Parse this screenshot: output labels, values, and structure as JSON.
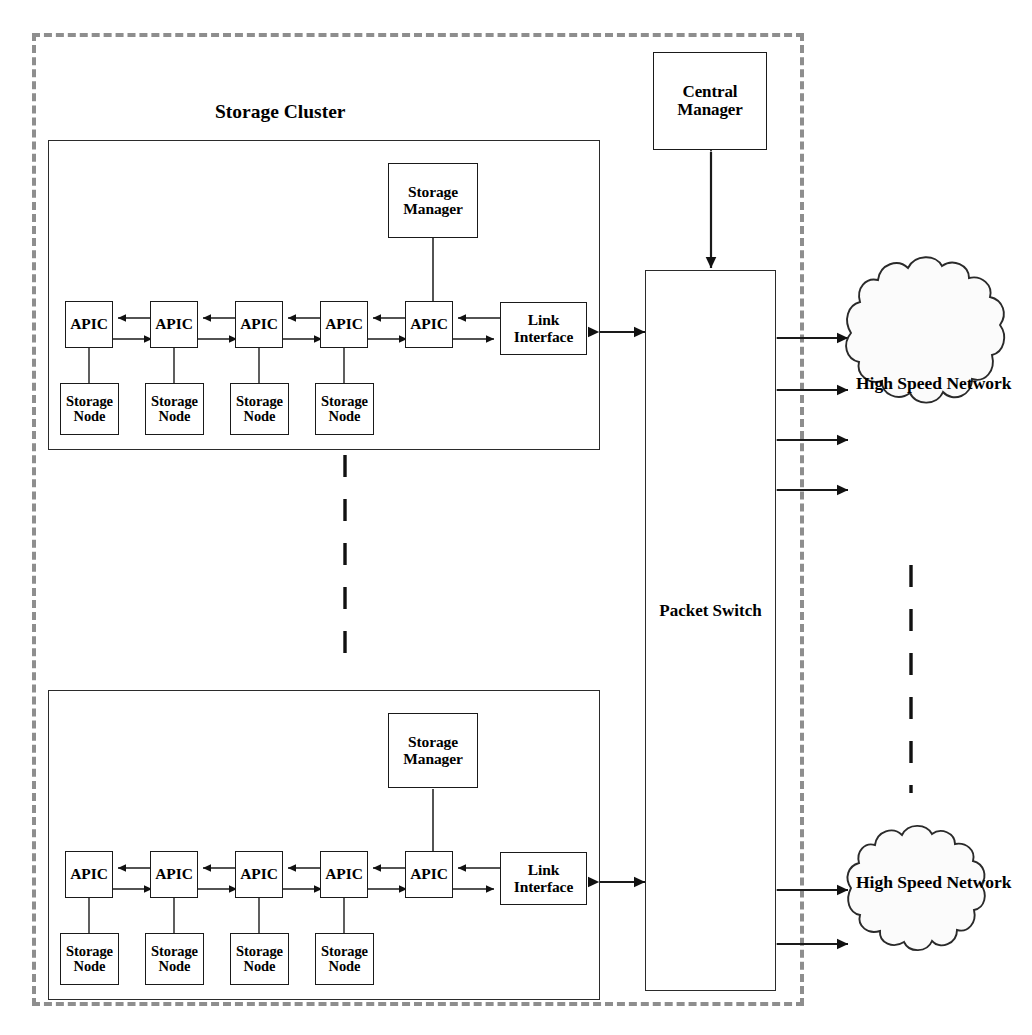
{
  "diagram": {
    "title_top": "Storage Cluster",
    "boundary": {
      "style": "dashed",
      "color": "#8e8e8e"
    },
    "line_color": "#1a1a1a"
  },
  "central_manager": {
    "label_line1": "Central",
    "label_line2": "Manager"
  },
  "packet_switch": {
    "label_line1": "Packet",
    "label_line2": "Switch"
  },
  "clusters": [
    {
      "id": "cluster-top",
      "title": "Storage Cluster",
      "storage_manager": {
        "line1": "Storage",
        "line2": "Manager"
      },
      "link_interface": {
        "line1": "Link",
        "line2": "Interface"
      },
      "apics": [
        {
          "label": "APIC"
        },
        {
          "label": "APIC"
        },
        {
          "label": "APIC"
        },
        {
          "label": "APIC"
        },
        {
          "label": "APIC"
        }
      ],
      "storage_nodes": [
        {
          "line1": "Storage",
          "line2": "Node"
        },
        {
          "line1": "Storage",
          "line2": "Node"
        },
        {
          "line1": "Storage",
          "line2": "Node"
        },
        {
          "line1": "Storage",
          "line2": "Node"
        }
      ]
    },
    {
      "id": "cluster-bottom",
      "title": "",
      "storage_manager": {
        "line1": "Storage",
        "line2": "Manager"
      },
      "link_interface": {
        "line1": "Link",
        "line2": "Interface"
      },
      "apics": [
        {
          "label": "APIC"
        },
        {
          "label": "APIC"
        },
        {
          "label": "APIC"
        },
        {
          "label": "APIC"
        },
        {
          "label": "APIC"
        }
      ],
      "storage_nodes": [
        {
          "line1": "Storage",
          "line2": "Node"
        },
        {
          "line1": "Storage",
          "line2": "Node"
        },
        {
          "line1": "Storage",
          "line2": "Node"
        },
        {
          "line1": "Storage",
          "line2": "Node"
        }
      ]
    }
  ],
  "networks": [
    {
      "id": "network-top",
      "line1": "High Speed",
      "line2": "Network",
      "links": 4
    },
    {
      "id": "network-bottom",
      "line1": "High Speed",
      "line2": "Network",
      "links": 2
    }
  ],
  "ellipses": [
    {
      "id": "cluster-ellipsis",
      "orientation": "vertical"
    },
    {
      "id": "network-ellipsis",
      "orientation": "vertical"
    }
  ]
}
